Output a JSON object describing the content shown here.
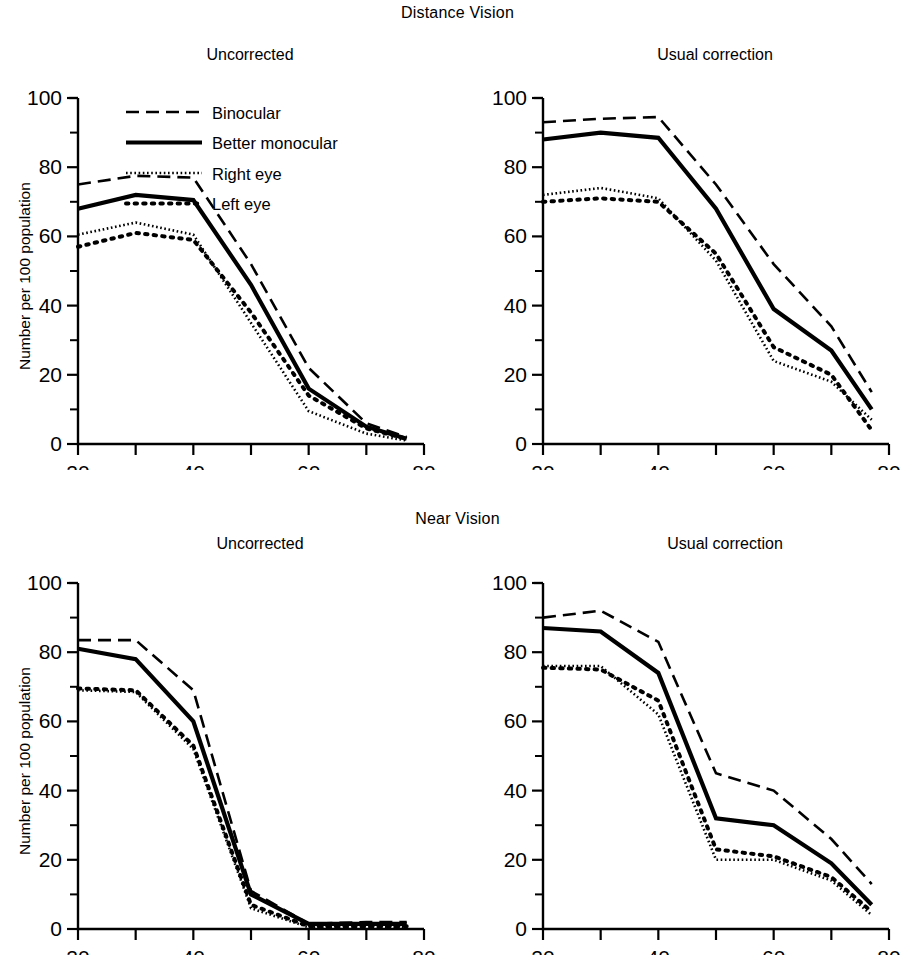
{
  "figure": {
    "section_titles": {
      "distance": "Distance Vision",
      "near": "Near Vision"
    },
    "axis": {
      "ylabel": "Number per 100 population",
      "xlabel": "Age in years",
      "yticks": [
        "0",
        "20",
        "40",
        "60",
        "80",
        "100"
      ],
      "xticks": [
        "20",
        "40",
        "60",
        "80"
      ]
    },
    "legend": {
      "items": [
        {
          "label": "Binocular",
          "style": "dashed"
        },
        {
          "label": "Better monocular",
          "style": "solid-thick"
        },
        {
          "label": "Right eye",
          "style": "fine-dotted"
        },
        {
          "label": "Left eye",
          "style": "bold-dotted"
        }
      ]
    },
    "panel_titles": {
      "uncorrected": "Uncorrected",
      "usual_correction": "Usual correction"
    }
  },
  "chart_data": [
    {
      "id": "distance-uncorrected",
      "type": "line",
      "title": "Uncorrected",
      "group": "Distance Vision",
      "xlabel": "Age in years",
      "ylabel": "Number per 100 population",
      "xlim": [
        20,
        80
      ],
      "ylim": [
        0,
        100
      ],
      "grid": false,
      "legend_position": "upper-right-inside",
      "x": [
        20,
        30,
        40,
        50,
        60,
        70,
        77
      ],
      "series": [
        {
          "name": "Binocular",
          "values": [
            75,
            77.5,
            77,
            52,
            22,
            6,
            2
          ]
        },
        {
          "name": "Better monocular",
          "values": [
            68,
            72,
            70.5,
            46,
            16,
            5,
            1.5
          ]
        },
        {
          "name": "Right eye",
          "values": [
            60.5,
            64,
            60.5,
            35,
            9.5,
            3,
            1
          ]
        },
        {
          "name": "Left eye",
          "values": [
            57,
            61,
            59,
            38,
            14,
            4.5,
            1.5
          ]
        }
      ]
    },
    {
      "id": "distance-usual-correction",
      "type": "line",
      "title": "Usual correction",
      "group": "Distance Vision",
      "xlabel": "Age in years",
      "ylabel": "Number per 100 population",
      "xlim": [
        20,
        80
      ],
      "ylim": [
        0,
        100
      ],
      "grid": false,
      "legend_position": "none",
      "x": [
        20,
        30,
        40,
        50,
        60,
        70,
        77
      ],
      "series": [
        {
          "name": "Binocular",
          "values": [
            93,
            94,
            94.5,
            75,
            52,
            34,
            15
          ]
        },
        {
          "name": "Better monocular",
          "values": [
            88,
            90,
            88.5,
            68,
            39,
            27,
            10
          ]
        },
        {
          "name": "Right eye",
          "values": [
            72,
            74,
            71,
            53,
            24,
            18,
            7
          ]
        },
        {
          "name": "Left eye",
          "values": [
            70,
            71,
            70,
            55,
            28,
            20,
            4
          ]
        }
      ]
    },
    {
      "id": "near-uncorrected",
      "type": "line",
      "title": "Uncorrected",
      "group": "Near Vision",
      "xlabel": "Age in years",
      "ylabel": "Number per 100 population",
      "xlim": [
        20,
        80
      ],
      "ylim": [
        0,
        100
      ],
      "grid": false,
      "legend_position": "none",
      "x": [
        20,
        30,
        40,
        50,
        60,
        70,
        77
      ],
      "series": [
        {
          "name": "Binocular",
          "values": [
            83.5,
            83.5,
            69,
            11,
            1.5,
            2,
            2
          ]
        },
        {
          "name": "Better monocular",
          "values": [
            81,
            78,
            60,
            10,
            1.5,
            1.5,
            1.5
          ]
        },
        {
          "name": "Right eye",
          "values": [
            69,
            68.5,
            52,
            6,
            0.5,
            0.5,
            0.5
          ]
        },
        {
          "name": "Left eye",
          "values": [
            69.5,
            69,
            53,
            7,
            0.8,
            0.8,
            0.8
          ]
        }
      ]
    },
    {
      "id": "near-usual-correction",
      "type": "line",
      "title": "Usual correction",
      "group": "Near Vision",
      "xlabel": "Age in years",
      "ylabel": "Number per 100 population",
      "xlim": [
        20,
        80
      ],
      "ylim": [
        0,
        100
      ],
      "grid": false,
      "legend_position": "none",
      "x": [
        20,
        30,
        40,
        50,
        60,
        70,
        77
      ],
      "series": [
        {
          "name": "Binocular",
          "values": [
            90,
            92,
            83,
            45,
            40,
            26,
            13
          ]
        },
        {
          "name": "Better monocular",
          "values": [
            87,
            86,
            74,
            32,
            30,
            19,
            7
          ]
        },
        {
          "name": "Right eye",
          "values": [
            76,
            76,
            62,
            20,
            20,
            14,
            4
          ]
        },
        {
          "name": "Left eye",
          "values": [
            75.5,
            75,
            66,
            23,
            21,
            15,
            5
          ]
        }
      ]
    }
  ]
}
